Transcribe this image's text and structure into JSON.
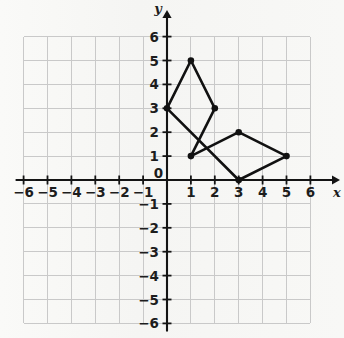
{
  "figure": {
    "type": "coordinate-plane",
    "axis_labels": {
      "x": "x",
      "y": "y"
    },
    "origin_label": "0"
  },
  "chart_data": {
    "type": "scatter",
    "title": "",
    "xlabel": "x",
    "ylabel": "y",
    "xlim": [
      -6,
      6
    ],
    "ylim": [
      -6,
      6
    ],
    "grid": true,
    "legend": "none",
    "x_tick_labels": [
      "-6",
      "-5",
      "-4",
      "-3",
      "-2",
      "-1",
      "0",
      "1",
      "2",
      "3",
      "4",
      "5",
      "6"
    ],
    "y_tick_labels": [
      "-6",
      "-5",
      "-4",
      "-3",
      "-2",
      "-1",
      "0",
      "1",
      "2",
      "3",
      "4",
      "5",
      "6"
    ],
    "x_ticks": [
      -6,
      -5,
      -4,
      -3,
      -2,
      -1,
      0,
      1,
      2,
      3,
      4,
      5,
      6
    ],
    "y_ticks": [
      -6,
      -5,
      -4,
      -3,
      -2,
      -1,
      0,
      1,
      2,
      3,
      4,
      5,
      6
    ],
    "series": [
      {
        "name": "polygon",
        "closed": true,
        "points": [
          {
            "x": 0,
            "y": 3
          },
          {
            "x": 1,
            "y": 5
          },
          {
            "x": 2,
            "y": 3
          },
          {
            "x": 1,
            "y": 1
          },
          {
            "x": 3,
            "y": 2
          },
          {
            "x": 5,
            "y": 1
          },
          {
            "x": 3,
            "y": 0
          }
        ]
      }
    ],
    "colors": {
      "stroke": "#111111",
      "marker": "#111111",
      "grid": "#c9c9c9",
      "axis": "#141414",
      "background": "#f7f7f5"
    }
  }
}
